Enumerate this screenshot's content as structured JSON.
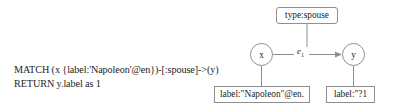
{
  "query": {
    "name": "cypher-query",
    "lines": [
      "MATCH (x {label:'Napoleon'@en})-[:spouse]->(y)",
      "RETURN y.label as 1"
    ]
  },
  "diagram": {
    "type": "graph-pattern",
    "stroke_color": "#8f8f8f",
    "text_color": "#232323",
    "nodes": [
      {
        "id": "x",
        "shape": "circle",
        "label": "x"
      },
      {
        "id": "y",
        "shape": "circle",
        "label": "y"
      }
    ],
    "edge": {
      "id": "e1",
      "label": "e",
      "subscript": "1",
      "from": "x",
      "to": "y",
      "directed": true
    },
    "property_boxes": [
      {
        "id": "type-spouse",
        "label": "type:spouse",
        "attached_to": "e1",
        "shape": "rounded-rect"
      },
      {
        "id": "label-napoleon",
        "label": "label:\"Napoleon\"@en.",
        "attached_to": "x",
        "shape": "rect"
      },
      {
        "id": "label-y",
        "label": "label:\"?1",
        "attached_to": "y",
        "shape": "rect"
      }
    ]
  }
}
